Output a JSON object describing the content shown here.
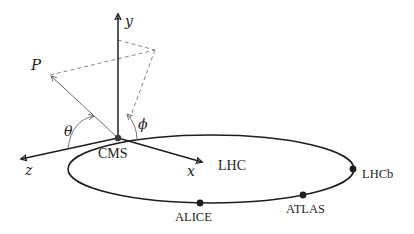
{
  "diagram": {
    "colors": {
      "ink": "#1e1e1e",
      "thin": "#6a6a6a",
      "dashed": "#7a7a7a",
      "background": "#ffffff"
    },
    "axes": {
      "y": "y",
      "z": "z",
      "x": "x"
    },
    "vector": {
      "label": "P"
    },
    "angles": {
      "theta": "θ",
      "phi": "ϕ"
    },
    "ring": {
      "label": "LHC"
    },
    "experiments": [
      {
        "name": "CMS"
      },
      {
        "name": "ALICE"
      },
      {
        "name": "ATLAS"
      },
      {
        "name": "LHCb"
      }
    ]
  }
}
